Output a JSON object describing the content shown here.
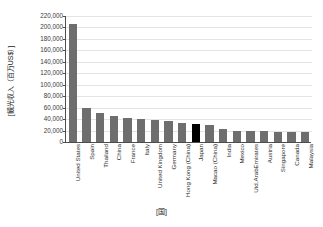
{
  "chart_data": {
    "type": "bar",
    "title": "",
    "xlabel": "[国]",
    "ylabel": "[観光収入（百万US$）]",
    "ylim": [
      0,
      220000
    ],
    "ytick_step": 20000,
    "grid": true,
    "legend": "none",
    "bar_color": "#6e6e6e",
    "highlight_color": "#000000",
    "highlight_category": "Japan",
    "ytick_labels": [
      "220,000",
      "200,000",
      "180,000",
      "160,000",
      "140,000",
      "120,000",
      "100,000",
      "80,000",
      "60,000",
      "40,000",
      "20,000",
      "0"
    ],
    "categories": [
      "United States",
      "Spain",
      "Thailand",
      "China",
      "France",
      "Italy",
      "United Kingdom",
      "Germany",
      "Hong Kong (China)",
      "Japan",
      "Macao (China)",
      "India",
      "Mexico",
      "Utd.ArabEmirates",
      "Austria",
      "Singapore",
      "Canada",
      "Malaysia"
    ],
    "values": [
      206000,
      60000,
      50000,
      45000,
      42000,
      40000,
      39000,
      37000,
      33000,
      31000,
      29000,
      22000,
      20000,
      20000,
      20000,
      18000,
      18000,
      17000
    ]
  }
}
